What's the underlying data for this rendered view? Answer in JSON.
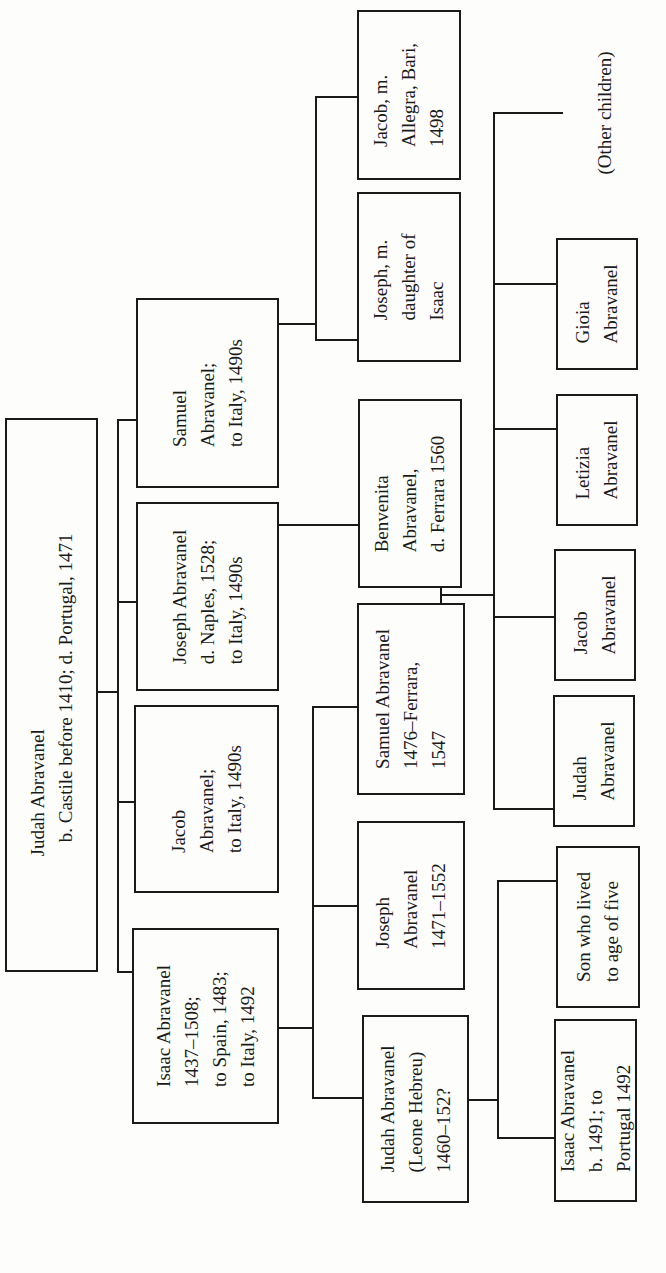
{
  "diagram": {
    "type": "family-tree",
    "orientation": "rotated-90-ccw",
    "line_color": "#1a1a1a",
    "background": "#fdfdfb"
  },
  "people": [
    {
      "id": "judah-root",
      "text": "Judah Abravanel\n   b. Castile before 1410; d. Portugal, 1471",
      "x": 5,
      "y": 418,
      "w": 93,
      "h": 554
    },
    {
      "id": "isaac",
      "text": "Isaac Abravanel\n1437–1508;\nto Spain, 1483;\nto Italy, 1492",
      "x": 132,
      "y": 928,
      "w": 147,
      "h": 196
    },
    {
      "id": "jacob-1",
      "text": "Jacob\nAbravanel;\nto Italy, 1490s",
      "x": 134,
      "y": 705,
      "w": 145,
      "h": 188
    },
    {
      "id": "joseph-1",
      "text": "Joseph Abravanel\nd. Naples, 1528;\nto Italy, 1490s",
      "x": 136,
      "y": 502,
      "w": 143,
      "h": 189
    },
    {
      "id": "samuel-1",
      "text": "Samuel\nAbravanel;\nto Italy, 1490s",
      "x": 136,
      "y": 298,
      "w": 143,
      "h": 190
    },
    {
      "id": "judah-leone",
      "text": "Judah Abravanel\n(Leone Hebreu)\n1460–152?",
      "x": 362,
      "y": 1015,
      "w": 107,
      "h": 188
    },
    {
      "id": "joseph-2",
      "text": "Joseph\nAbravanel\n1471–1552",
      "x": 357,
      "y": 821,
      "w": 108,
      "h": 169
    },
    {
      "id": "samuel-2",
      "text": "Samuel Abravanel\n1476–Ferrara,\n1547",
      "x": 357,
      "y": 603,
      "w": 108,
      "h": 192
    },
    {
      "id": "benvenita",
      "text": "Benvenita\nAbravanel,\nd. Ferrara 1560",
      "x": 358,
      "y": 399,
      "w": 104,
      "h": 189
    },
    {
      "id": "joseph-3",
      "text": "Joseph, m.\ndaughter of\nIsaac",
      "x": 357,
      "y": 192,
      "w": 104,
      "h": 170
    },
    {
      "id": "jacob-3",
      "text": "Jacob, m.\nAllegra, Bari,\n1498",
      "x": 357,
      "y": 10,
      "w": 104,
      "h": 170
    },
    {
      "id": "isaac-2",
      "text": "Isaac Abravanel\nb. 1491; to\nPortugal 1492",
      "x": 554,
      "y": 1019,
      "w": 83,
      "h": 183
    },
    {
      "id": "son-five",
      "text": "Son who lived\nto age of five",
      "x": 556,
      "y": 846,
      "w": 84,
      "h": 162
    },
    {
      "id": "judah-3",
      "text": "Judah\nAbravanel",
      "x": 553,
      "y": 695,
      "w": 82,
      "h": 132
    },
    {
      "id": "jacob-4",
      "text": "Jacob\nAbravanel",
      "x": 554,
      "y": 549,
      "w": 82,
      "h": 132
    },
    {
      "id": "letizia",
      "text": "Letizia\nAbravanel",
      "x": 556,
      "y": 394,
      "w": 82,
      "h": 132
    },
    {
      "id": "gioia",
      "text": "Gioia\nAbravanel",
      "x": 556,
      "y": 238,
      "w": 82,
      "h": 132
    }
  ],
  "other_children_label": {
    "text": "(Other children)",
    "x": 582,
    "y": 28,
    "w": 46,
    "h": 170
  },
  "connectors": [
    {
      "x": 97,
      "y": 691,
      "w": 22,
      "h": 2
    },
    {
      "x": 117,
      "y": 419,
      "w": 2,
      "h": 553
    },
    {
      "x": 117,
      "y": 419,
      "w": 19,
      "h": 2
    },
    {
      "x": 117,
      "y": 601,
      "w": 19,
      "h": 2
    },
    {
      "x": 117,
      "y": 801,
      "w": 19,
      "h": 2
    },
    {
      "x": 117,
      "y": 971,
      "w": 17,
      "h": 2
    },
    {
      "x": 278,
      "y": 1027,
      "w": 36,
      "h": 2
    },
    {
      "x": 312,
      "y": 706,
      "w": 2,
      "h": 393
    },
    {
      "x": 312,
      "y": 706,
      "w": 46,
      "h": 2
    },
    {
      "x": 312,
      "y": 905,
      "w": 46,
      "h": 2
    },
    {
      "x": 312,
      "y": 1097,
      "w": 50,
      "h": 2
    },
    {
      "x": 278,
      "y": 524,
      "w": 81,
      "h": 2
    },
    {
      "x": 278,
      "y": 323,
      "w": 38,
      "h": 2
    },
    {
      "x": 315,
      "y": 96,
      "w": 2,
      "h": 245
    },
    {
      "x": 315,
      "y": 96,
      "w": 43,
      "h": 2
    },
    {
      "x": 315,
      "y": 339,
      "w": 43,
      "h": 2
    },
    {
      "x": 440,
      "y": 587,
      "w": 2,
      "h": 16
    },
    {
      "x": 440,
      "y": 594,
      "w": 55,
      "h": 2
    },
    {
      "x": 493,
      "y": 112,
      "w": 2,
      "h": 698
    },
    {
      "x": 493,
      "y": 112,
      "w": 70,
      "h": 2
    },
    {
      "x": 493,
      "y": 283,
      "w": 63,
      "h": 2
    },
    {
      "x": 493,
      "y": 428,
      "w": 63,
      "h": 2
    },
    {
      "x": 493,
      "y": 616,
      "w": 61,
      "h": 2
    },
    {
      "x": 493,
      "y": 808,
      "w": 60,
      "h": 2
    },
    {
      "x": 468,
      "y": 1099,
      "w": 31,
      "h": 2
    },
    {
      "x": 497,
      "y": 880,
      "w": 2,
      "h": 259
    },
    {
      "x": 497,
      "y": 880,
      "w": 59,
      "h": 2
    },
    {
      "x": 497,
      "y": 1137,
      "w": 57,
      "h": 2
    }
  ]
}
